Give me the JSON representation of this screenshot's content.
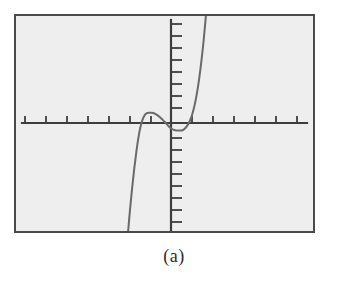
{
  "figure": {
    "caption": "(a)",
    "label": "(a)",
    "background_color": "#ffffff",
    "plot_background_color": "#eeeeee",
    "frame_color": "#4a4a4a",
    "axis_color": "#3d3d3d",
    "curve_color": "#6a6a6a"
  },
  "chart_data": {
    "type": "line",
    "title": "",
    "subtitle": "",
    "xlabel": "",
    "ylabel": "",
    "caption": "(a)",
    "grid": false,
    "legend": null,
    "legend_position": "none",
    "axis_tick_labels_shown": false,
    "xlim": [
      -7,
      7
    ],
    "ylim": [
      -5.0,
      5.0
    ],
    "xtick_count": 14,
    "ytick_count": 17,
    "xticks": [
      -6.5,
      -5.5,
      -4.5,
      -3.5,
      -2.5,
      -1.5,
      -0.5,
      0.5,
      1.5,
      2.5,
      3.5,
      4.5,
      5.5,
      6.5
    ],
    "yticks": [
      -4.5,
      -4.0,
      -3.5,
      -3.0,
      -2.5,
      -2.0,
      -1.5,
      -1.0,
      -0.5,
      0.5,
      1.0,
      1.5,
      2.0,
      2.5,
      3.0,
      3.5,
      4.0
    ],
    "xtick_spacing": 1,
    "ytick_spacing": 0.5,
    "x_axis_y_value": 0,
    "y_axis_x_value": 0,
    "features": {
      "local_maximum": {
        "x": -0.85,
        "y": 0.42
      },
      "local_minimum": {
        "x": 0.55,
        "y": -0.3
      },
      "x_intercepts": [
        -1.6,
        -0.25,
        1.35
      ],
      "y_intercept": 0.12
    },
    "x": [
      -2.05,
      -1.95,
      -1.85,
      -1.75,
      -1.65,
      -1.55,
      -1.45,
      -1.35,
      -1.25,
      -1.15,
      -1.05,
      -0.95,
      -0.85,
      -0.75,
      -0.65,
      -0.55,
      -0.45,
      -0.35,
      -0.25,
      -0.15,
      -0.05,
      0.05,
      0.15,
      0.25,
      0.35,
      0.45,
      0.55,
      0.65,
      0.75,
      0.85,
      0.95,
      1.05,
      1.15,
      1.25,
      1.35,
      1.45,
      1.55,
      1.65,
      1.75
    ],
    "y": [
      -4.6,
      -3.6,
      -2.7,
      -1.9,
      -1.2,
      -0.6,
      -0.15,
      0.15,
      0.33,
      0.41,
      0.43,
      0.43,
      0.42,
      0.38,
      0.33,
      0.26,
      0.18,
      0.09,
      0.0,
      -0.1,
      -0.19,
      -0.25,
      -0.29,
      -0.31,
      -0.31,
      -0.31,
      -0.3,
      -0.24,
      -0.14,
      0.0,
      0.2,
      0.48,
      0.85,
      1.32,
      1.9,
      2.6,
      3.4,
      4.35,
      5.4
    ],
    "series": [
      {
        "name": "curve",
        "color": "#6a6a6a",
        "style": "solid",
        "width": 2
      }
    ]
  }
}
